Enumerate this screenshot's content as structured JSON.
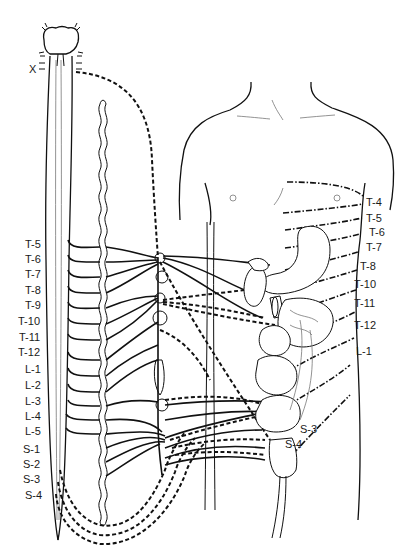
{
  "diagram": {
    "type": "anatomical-illustration",
    "colors": {
      "line": "#111111",
      "background": "#ffffff"
    },
    "cranial_label": "X",
    "spinal_segment_labels": [
      "T-5",
      "T-6",
      "T-7",
      "T-8",
      "T-9",
      "T-10",
      "T-11",
      "T-12",
      "L-1",
      "L-2",
      "L-3",
      "L-4",
      "L-5",
      "S-1",
      "S-2",
      "S-3",
      "S-4"
    ],
    "dermatome_labels": [
      "T-4",
      "T-5",
      "T-6",
      "T-7",
      "T-8",
      "T-10",
      "T-11",
      "T-12",
      "L-1"
    ],
    "perineal_labels": [
      "S-3",
      "S-4"
    ],
    "line_legend": {
      "solid": "sympathetic pathways",
      "dashed": "parasympathetic pathways",
      "dash-dot": "dermatome boundaries"
    }
  }
}
